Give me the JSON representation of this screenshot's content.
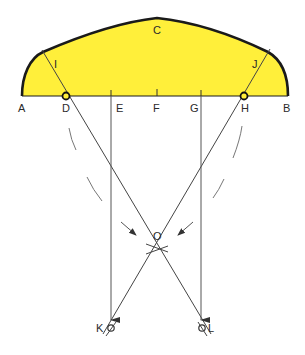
{
  "colors": {
    "fill": "#ffef3a",
    "outline": "#1a1a1a",
    "line": "#444444",
    "dash": "#777777"
  },
  "labels": {
    "A": "A",
    "B": "B",
    "C": "C",
    "D": "D",
    "E": "E",
    "F": "F",
    "G": "G",
    "H": "H",
    "I": "I",
    "J": "J",
    "K": "K",
    "L": "L",
    "O": "O"
  },
  "points": {
    "A": [
      22,
      96
    ],
    "B": [
      288,
      96
    ],
    "C": [
      157,
      18
    ],
    "D": [
      66,
      96
    ],
    "E": [
      111,
      96
    ],
    "F": [
      157,
      96
    ],
    "G": [
      201,
      96
    ],
    "H": [
      244,
      96
    ],
    "I": [
      43,
      52
    ],
    "J": [
      268,
      52
    ],
    "O": [
      157,
      249
    ],
    "K": [
      111,
      328
    ],
    "L": [
      202,
      328
    ]
  }
}
